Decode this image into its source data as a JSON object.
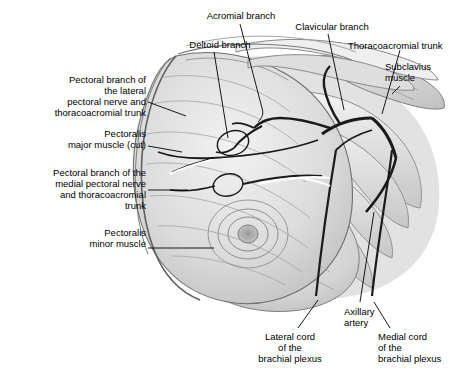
{
  "figure": {
    "background_color": "#ffffff",
    "line_color": "#000000",
    "vessel_color": "#1a1a1a",
    "muscle_fill_light": "#e8e8e8",
    "muscle_fill_mid": "#cfcfcf",
    "muscle_fill_dark": "#b0b0b0",
    "labels": [
      {
        "id": "acromial-branch",
        "text": "Acromial branch",
        "align": "center",
        "x": 196,
        "y": 10,
        "width": 90
      },
      {
        "id": "clavicular-branch",
        "text": "Clavicular branch",
        "align": "center",
        "x": 285,
        "y": 21,
        "width": 94
      },
      {
        "id": "thoracoacromial-trunk",
        "text": "Thoracoacromial trunk",
        "align": "left",
        "x": 348,
        "y": 40,
        "width": 120
      },
      {
        "id": "deltoid-branch",
        "text": "Deltoid branch",
        "align": "center",
        "x": 180,
        "y": 39,
        "width": 80
      },
      {
        "id": "subclavius-muscle",
        "text": "Subclavius\nmuscle",
        "align": "left",
        "x": 385,
        "y": 61,
        "width": 80
      },
      {
        "id": "pectoral-branch-lateral",
        "text": "Pectoral branch of\nthe lateral\npectoral nerve and\nthoracoacromial trunk",
        "align": "right",
        "x": 22,
        "y": 74,
        "width": 124
      },
      {
        "id": "pectoralis-major-cut",
        "text": "Pectoralis\nmajor muscle (cut)",
        "align": "right",
        "x": 40,
        "y": 128,
        "width": 106
      },
      {
        "id": "pectoral-branch-medial",
        "text": "Pectoral branch of the\nmedial pectoral nerve\nand thoracoacromial\ntrunk",
        "align": "right",
        "x": 10,
        "y": 167,
        "width": 136
      },
      {
        "id": "pectoralis-minor-muscle",
        "text": "Pectoralis\nminor muscle",
        "align": "right",
        "x": 60,
        "y": 227,
        "width": 86
      },
      {
        "id": "axillary-artery",
        "text": "Axillary\nartery",
        "align": "left",
        "x": 344,
        "y": 306,
        "width": 60
      },
      {
        "id": "lateral-cord",
        "text": "Lateral cord\nof the\nbrachial plexus",
        "align": "center",
        "x": 244,
        "y": 331,
        "width": 92
      },
      {
        "id": "medial-cord",
        "text": "Medial cord\nof the\nbrachial plexus",
        "align": "left",
        "x": 378,
        "y": 331,
        "width": 88
      }
    ]
  }
}
